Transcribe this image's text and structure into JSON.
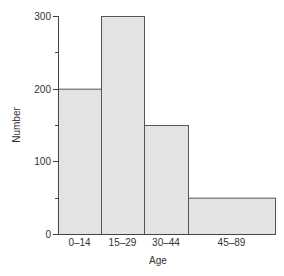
{
  "chart_data": {
    "type": "bar",
    "subtype": "histogram",
    "title": "",
    "xlabel": "Age",
    "ylabel": "Number",
    "categories": [
      "0–14",
      "15–29",
      "30–44",
      "45–89"
    ],
    "values": [
      200,
      300,
      150,
      50
    ],
    "bin_edges_px": [
      58,
      101,
      144,
      188,
      275
    ],
    "ylim": [
      0,
      300
    ],
    "yticks_major": [
      0,
      100,
      200,
      300
    ],
    "yticks_major_labels": [
      "0",
      "100",
      "200",
      "300"
    ],
    "yticks_minor": [
      50,
      150,
      250
    ],
    "grid": false,
    "legend": null,
    "colors": {
      "bar_fill": "#e3e3e3",
      "bar_stroke": "#555555",
      "axis": "#444444",
      "text": "#333333"
    }
  }
}
